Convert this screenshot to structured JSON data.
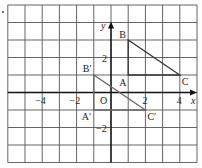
{
  "diagram": {
    "grid": {
      "x_min": -6,
      "x_max": 5,
      "y_min": -4,
      "y_max": 5,
      "origin_px": [
        111,
        92.5
      ],
      "cell_w": 17.2,
      "cell_h": 17.5,
      "left_px": 8,
      "top_px": 5
    },
    "axes": {
      "x_label": "x",
      "y_label": "y",
      "origin_label": "O"
    },
    "x_ticks": [
      {
        "value": -4,
        "label": "−4"
      },
      {
        "value": -2,
        "label": "−2"
      },
      {
        "value": 2,
        "label": "2"
      },
      {
        "value": 4,
        "label": "4"
      }
    ],
    "y_ticks": [
      {
        "value": 2,
        "label": "2"
      },
      {
        "value": -2,
        "label": "−2"
      }
    ],
    "triangles": [
      {
        "name": "ABC",
        "color": "#333333",
        "points": [
          {
            "label": "A",
            "x": 1,
            "y": 1
          },
          {
            "label": "B",
            "x": 1,
            "y": 3
          },
          {
            "label": "C",
            "x": 4,
            "y": 1
          }
        ]
      },
      {
        "name": "A'B'C'",
        "color": "#555555",
        "points": [
          {
            "label": "A′",
            "x": -1,
            "y": -1
          },
          {
            "label": "B′",
            "x": -1,
            "y": 1
          },
          {
            "label": "C′",
            "x": 2,
            "y": -1
          }
        ]
      }
    ],
    "colors": {
      "grid": "#555555",
      "axis": "#111111",
      "triangle": "#333333",
      "image_triangle": "#666666"
    }
  }
}
